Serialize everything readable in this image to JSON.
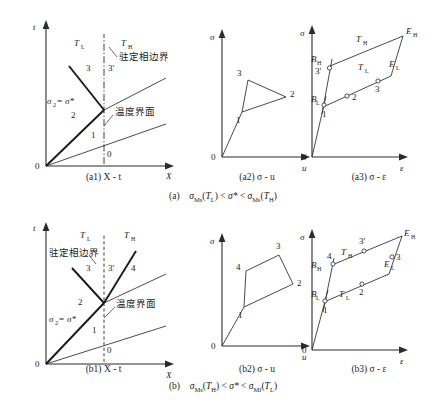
{
  "figure": {
    "title_rows": [
      {
        "id": "row-a",
        "caption": "(a)  σMs(TL) < σ* < σMs(TH)",
        "caption_parts": {
          "prefix": "(a)",
          "left": "σ",
          "left_sub": "Ms",
          "left_arg": "T",
          "left_arg_sub": "L",
          "mid": "σ*",
          "right": "σ",
          "right_sub": "Ms",
          "right_arg": "T",
          "right_arg_sub": "H"
        }
      },
      {
        "id": "row-b",
        "caption": "(b)  σMs(TH) < σ* < σMf(TL)",
        "caption_parts": {
          "prefix": "(b)",
          "left": "σ",
          "left_sub": "Ms",
          "left_arg": "T",
          "left_arg_sub": "H",
          "mid": "σ*",
          "right": "σ",
          "right_sub": "Mf",
          "right_arg": "T",
          "right_arg_sub": "L"
        }
      }
    ]
  },
  "panels": {
    "a1": {
      "caption": "(a1)  X - t",
      "caption_prefix": "(a1)",
      "caption_axes": "X - t",
      "axis_x_label": "X",
      "axis_y_label": "t",
      "origin_label": "0",
      "region_labels": [
        {
          "name": "T-low",
          "base": "T",
          "sub": "L"
        },
        {
          "name": "T-high",
          "base": "T",
          "sub": "H"
        }
      ],
      "wave_labels": [
        "3",
        "3'",
        "2",
        "1",
        "0"
      ],
      "sigma_label": {
        "base": "σ",
        "sub": "2",
        "eq": "=",
        "rhs": "σ*"
      },
      "annotations": [
        {
          "name": "stationary-phase-boundary",
          "text": "驻定相边界"
        },
        {
          "name": "temperature-interface",
          "text": "温度界面"
        }
      ]
    },
    "a2": {
      "caption": "(a2)  σ - u",
      "caption_prefix": "(a2)",
      "caption_axes": "σ - u",
      "axis_x_label": "u",
      "axis_y_label": "σ",
      "origin_label": "0",
      "point_labels": [
        "3",
        "2",
        "1"
      ]
    },
    "a3": {
      "caption": "(a3)  σ - ε",
      "caption_prefix": "(a3)",
      "caption_axes": "σ - ε",
      "axis_x_label": "ε",
      "axis_y_label": "σ",
      "origin_label": "0",
      "point_labels": [
        "3'",
        "1",
        "2",
        "3"
      ],
      "curve_labels": [
        {
          "name": "T-high",
          "base": "T",
          "sub": "H"
        },
        {
          "name": "T-low",
          "base": "T",
          "sub": "L"
        }
      ],
      "end_labels": [
        {
          "name": "B-high",
          "base": "B",
          "sub": "H"
        },
        {
          "name": "B-low",
          "base": "B",
          "sub": "L"
        },
        {
          "name": "E-high",
          "base": "E",
          "sub": "H"
        },
        {
          "name": "E-low",
          "base": "E",
          "sub": "L"
        }
      ]
    },
    "b1": {
      "caption": "(b1)  X - t",
      "caption_prefix": "(b1)",
      "caption_axes": "X - t",
      "axis_x_label": "X",
      "axis_y_label": "t",
      "origin_label": "0",
      "region_labels": [
        {
          "name": "T-low",
          "base": "T",
          "sub": "L"
        },
        {
          "name": "T-high",
          "base": "T",
          "sub": "H"
        }
      ],
      "wave_labels": [
        "3",
        "3'",
        "4",
        "2",
        "1",
        "0"
      ],
      "sigma_label": {
        "base": "σ",
        "sub": "2",
        "eq": "=",
        "rhs": "σ*"
      },
      "annotations": [
        {
          "name": "stationary-phase-boundary",
          "text": "驻定相边界"
        },
        {
          "name": "temperature-interface",
          "text": "温度界面"
        }
      ]
    },
    "b2": {
      "caption": "(b2)  σ - u",
      "caption_prefix": "(b2)",
      "caption_axes": "σ - u",
      "axis_x_label": "u",
      "axis_y_label": "σ",
      "origin_label": "0",
      "point_labels": [
        "3",
        "4",
        "2",
        "1"
      ]
    },
    "b3": {
      "caption": "(b3)  σ - ε",
      "caption_prefix": "(b3)",
      "caption_axes": "σ - ε",
      "axis_x_label": "ε",
      "axis_y_label": "σ",
      "origin_label": "0",
      "point_labels": [
        "3'",
        "4",
        "3",
        "2",
        "1"
      ],
      "curve_labels": [
        {
          "name": "T-high",
          "base": "T",
          "sub": "H"
        },
        {
          "name": "T-low",
          "base": "T",
          "sub": "L"
        }
      ],
      "end_labels": [
        {
          "name": "B-high",
          "base": "B",
          "sub": "H"
        },
        {
          "name": "B-low",
          "base": "B",
          "sub": "L"
        },
        {
          "name": "E-high",
          "base": "E",
          "sub": "H"
        },
        {
          "name": "E-low",
          "base": "E",
          "sub": "L"
        }
      ]
    }
  },
  "colors": {
    "ink": "#1a1a1a",
    "line": "#2b2b2b",
    "background": "#ffffff"
  }
}
